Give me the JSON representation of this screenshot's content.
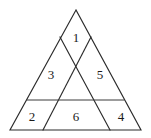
{
  "figure": {
    "type": "geometric-figure",
    "shape": "triangle",
    "stroke_color": "#2b2b2b",
    "background_color": "#ffffff",
    "label_color": "#1a1a1a",
    "vertices": {
      "apex": [
        76,
        10
      ],
      "bottom_left": [
        10,
        130
      ],
      "bottom_right": [
        141,
        130
      ]
    },
    "construction_lines": [
      {
        "name": "left-cevian",
        "from": [
          60,
          37
        ],
        "to": [
          110,
          130
        ]
      },
      {
        "name": "right-cevian",
        "from": [
          91,
          37
        ],
        "to": [
          43,
          130
        ]
      },
      {
        "name": "horizontal-divider",
        "from": [
          27,
          100
        ],
        "to": [
          124,
          100
        ]
      }
    ],
    "regions": [
      {
        "id": "region-1",
        "label": "1",
        "x": 76,
        "y": 38
      },
      {
        "id": "region-3",
        "label": "3",
        "x": 51,
        "y": 75
      },
      {
        "id": "region-5",
        "label": "5",
        "x": 100,
        "y": 75
      },
      {
        "id": "region-2",
        "label": "2",
        "x": 32,
        "y": 117
      },
      {
        "id": "region-6",
        "label": "6",
        "x": 76,
        "y": 117
      },
      {
        "id": "region-4",
        "label": "4",
        "x": 121,
        "y": 117
      }
    ]
  }
}
